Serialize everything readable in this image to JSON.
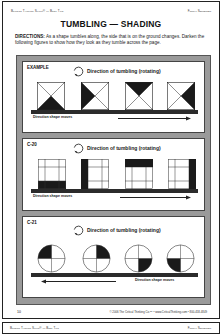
{
  "header": {
    "left": "Building Thinking Skills® — Book Two",
    "right": "Figural Sequences"
  },
  "title": "TUMBLING — SHADING",
  "directions": {
    "label": "DIRECTIONS:",
    "text": " As a shape tumbles along, the side that is on the ground changes. Darken the following figures to show how they look as they tumble across the page."
  },
  "panels": [
    {
      "label": "EXAMPLE",
      "rotation_label": "Direction of tumbling (rotating)",
      "moves_label": "Direction shape moves",
      "moves_direction": "right",
      "shape_type": "square-x",
      "shaded": [
        "bottom",
        "left",
        "top",
        "right"
      ]
    },
    {
      "label": "C-20",
      "rotation_label": "Direction of tumbling (rotating)",
      "moves_label": "Direction shape moves",
      "moves_direction": "right",
      "shape_type": "grid-3x3",
      "shaded": [
        "bottom",
        "left",
        "top",
        "right"
      ]
    },
    {
      "label": "C-21",
      "rotation_label": "Direction of tumbling (rotating)",
      "moves_label": "Direction shape moves",
      "moves_direction": "left",
      "shape_type": "circle-quadrants",
      "shaded": [
        "top-left",
        "top-right",
        "bottom-right",
        "bottom-left"
      ]
    }
  ],
  "footer": {
    "page_number": "10",
    "copyright": "© 2006 The Critical Thinking Co.™ • www.CriticalThinking.com • 800-458-4849"
  },
  "next_page_header": {
    "left": "Building Thinking Skills® — Book Two",
    "right": "Figural Sequences"
  },
  "colors": {
    "frame": "#9a9a9a",
    "ink": "#1a1a1a"
  }
}
